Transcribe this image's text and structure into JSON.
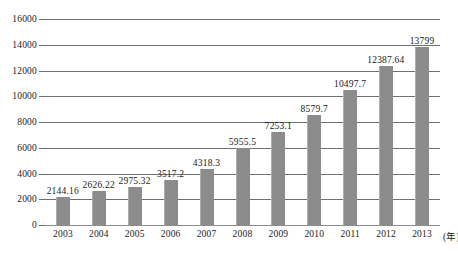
{
  "chart_data": {
    "type": "bar",
    "title": "",
    "subtitle": "",
    "xlabel": "",
    "ylabel": "",
    "x_unit_label": "(年)",
    "categories": [
      "2003",
      "2004",
      "2005",
      "2006",
      "2007",
      "2008",
      "2009",
      "2010",
      "2011",
      "2012",
      "2013"
    ],
    "values": [
      2144.16,
      2626.22,
      2975.32,
      3517.2,
      4318.3,
      5955.5,
      7253.1,
      8579.7,
      10497.7,
      12387.64,
      13799
    ],
    "value_labels": [
      "2144.16",
      "2626.22",
      "2975.32",
      "3517.2",
      "4318.3",
      "5955.5",
      "7253.1",
      "8579.7",
      "10497.7",
      "12387.64",
      "13799"
    ],
    "ylim": [
      0,
      16000
    ],
    "y_ticks": [
      0,
      2000,
      4000,
      6000,
      8000,
      10000,
      12000,
      14000,
      16000
    ],
    "y_tick_labels": [
      "0",
      "2000",
      "4000",
      "6000",
      "8000",
      "10000",
      "12000",
      "14000",
      "16000"
    ],
    "grid": true,
    "legend": null,
    "legend_position": "none",
    "bar_color": "#8c8c8c",
    "gridline_color": "#6f6f6f",
    "text_color": "#1a1a1a"
  }
}
